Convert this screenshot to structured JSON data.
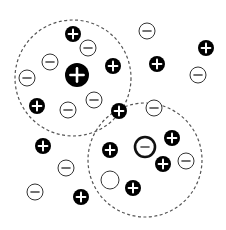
{
  "diagram": {
    "title": "",
    "colors": {
      "background": "#ffffff",
      "positive_fill": "#000000",
      "positive_sign": "#ffffff",
      "negative_fill": "#ffffff",
      "negative_stroke": "#333333",
      "boundary": "#555555"
    },
    "regions": [
      {
        "name": "left-region",
        "cx": 73,
        "cy": 78,
        "r": 58,
        "style": "dashed"
      },
      {
        "name": "right-region",
        "cx": 145,
        "cy": 160,
        "r": 57,
        "style": "dashed"
      }
    ],
    "particles": [
      {
        "charge": "+",
        "cx": 73,
        "cy": 34,
        "r": 8
      },
      {
        "charge": "-",
        "cx": 88,
        "cy": 48,
        "r": 8
      },
      {
        "charge": "-",
        "cx": 50,
        "cy": 62,
        "r": 8
      },
      {
        "charge": "-",
        "cx": 27,
        "cy": 78,
        "r": 8
      },
      {
        "charge": "+",
        "cx": 77,
        "cy": 75,
        "r": 12,
        "size": "large"
      },
      {
        "charge": "+",
        "cx": 113,
        "cy": 66,
        "r": 8
      },
      {
        "charge": "-",
        "cx": 147,
        "cy": 31,
        "r": 8
      },
      {
        "charge": "+",
        "cx": 157,
        "cy": 64,
        "r": 8
      },
      {
        "charge": "+",
        "cx": 206,
        "cy": 48,
        "r": 8
      },
      {
        "charge": "-",
        "cx": 198,
        "cy": 75,
        "r": 8
      },
      {
        "charge": "+",
        "cx": 37,
        "cy": 106,
        "r": 8
      },
      {
        "charge": "-",
        "cx": 68,
        "cy": 110,
        "r": 8
      },
      {
        "charge": "-",
        "cx": 94,
        "cy": 100,
        "r": 8
      },
      {
        "charge": "+",
        "cx": 119,
        "cy": 111,
        "r": 8
      },
      {
        "charge": "-",
        "cx": 154,
        "cy": 108,
        "r": 8
      },
      {
        "charge": "+",
        "cx": 43,
        "cy": 146,
        "r": 8
      },
      {
        "charge": "-",
        "cx": 66,
        "cy": 168,
        "r": 8
      },
      {
        "charge": "-",
        "cx": 35,
        "cy": 192,
        "r": 8
      },
      {
        "charge": "+",
        "cx": 81,
        "cy": 197,
        "r": 8
      },
      {
        "charge": "+",
        "cx": 110,
        "cy": 150,
        "r": 8
      },
      {
        "charge": "-",
        "cx": 145,
        "cy": 147,
        "r": 10,
        "style": "thick-ring"
      },
      {
        "charge": "+",
        "cx": 172,
        "cy": 138,
        "r": 8
      },
      {
        "charge": "+",
        "cx": 163,
        "cy": 164,
        "r": 8
      },
      {
        "charge": "-",
        "cx": 186,
        "cy": 161,
        "r": 8
      },
      {
        "charge": "none",
        "cx": 110,
        "cy": 180,
        "r": 9
      },
      {
        "charge": "+",
        "cx": 133,
        "cy": 188,
        "r": 8
      }
    ]
  }
}
